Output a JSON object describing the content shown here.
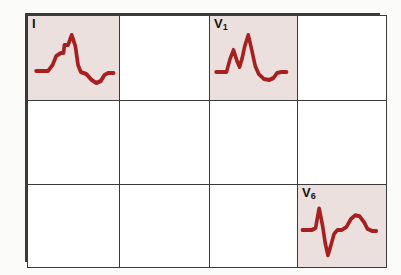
{
  "figure": {
    "name": "ecg-lead-grid",
    "background_color": "#fbfbf9",
    "border_color": "#3a3a3a",
    "cell_background": "#ffffff",
    "highlight_color": "#ece0df",
    "waveform_color": "#a62020",
    "columns": 4,
    "rows": 3
  },
  "cells": [
    {
      "row": 0,
      "col": 0,
      "label": "I",
      "label_base": "I",
      "label_sub": "",
      "highlighted": true,
      "has_waveform": true,
      "waveform_name": "lead-i-waveform",
      "morphology": "slurred notched R wave with tall peak and negative T wave",
      "path": "M 9 55 L 22 55 L 27 49 L 31 40 L 36 37 L 39 37 L 40 29 L 44 29 L 48 19 L 52 30 L 55 49 L 58 56 L 64 58 L 70 64 L 75 67 L 80 65 L 84 59 L 88 57 L 94 57"
    },
    {
      "row": 0,
      "col": 1,
      "label": "",
      "label_base": "",
      "label_sub": "",
      "highlighted": false,
      "has_waveform": false,
      "waveform_name": "",
      "morphology": "",
      "path": ""
    },
    {
      "row": 0,
      "col": 2,
      "label": "V1",
      "label_base": "V",
      "label_sub": "1",
      "highlighted": true,
      "has_waveform": true,
      "waveform_name": "lead-v1-waveform",
      "morphology": "rSR prime M-shaped complex with negative T wave",
      "path": "M 7 56 L 19 56 L 23 43 L 27 34 L 31 45 L 34 51 L 37 42 L 40 30 L 44 19 L 48 34 L 52 50 L 56 58 L 62 63 L 68 64 L 73 62 L 77 57 L 82 56 L 88 56"
    },
    {
      "row": 0,
      "col": 3,
      "label": "",
      "label_base": "",
      "label_sub": "",
      "highlighted": false,
      "has_waveform": false,
      "waveform_name": "",
      "morphology": "",
      "path": ""
    },
    {
      "row": 1,
      "col": 0,
      "label": "",
      "label_base": "",
      "label_sub": "",
      "highlighted": false,
      "has_waveform": false,
      "waveform_name": "",
      "morphology": "",
      "path": ""
    },
    {
      "row": 1,
      "col": 1,
      "label": "",
      "label_base": "",
      "label_sub": "",
      "highlighted": false,
      "has_waveform": false,
      "waveform_name": "",
      "morphology": "",
      "path": ""
    },
    {
      "row": 1,
      "col": 2,
      "label": "",
      "label_base": "",
      "label_sub": "",
      "highlighted": false,
      "has_waveform": false,
      "waveform_name": "",
      "morphology": "",
      "path": ""
    },
    {
      "row": 1,
      "col": 3,
      "label": "",
      "label_base": "",
      "label_sub": "",
      "highlighted": false,
      "has_waveform": false,
      "waveform_name": "",
      "morphology": "",
      "path": ""
    },
    {
      "row": 2,
      "col": 0,
      "label": "",
      "label_base": "",
      "label_sub": "",
      "highlighted": false,
      "has_waveform": false,
      "waveform_name": "",
      "morphology": "",
      "path": ""
    },
    {
      "row": 2,
      "col": 1,
      "label": "",
      "label_base": "",
      "label_sub": "",
      "highlighted": false,
      "has_waveform": false,
      "waveform_name": "",
      "morphology": "",
      "path": ""
    },
    {
      "row": 2,
      "col": 2,
      "label": "",
      "label_base": "",
      "label_sub": "",
      "highlighted": false,
      "has_waveform": false,
      "waveform_name": "",
      "morphology": "",
      "path": ""
    },
    {
      "row": 2,
      "col": 3,
      "label": "V6",
      "label_base": "V",
      "label_sub": "6",
      "highlighted": true,
      "has_waveform": true,
      "waveform_name": "lead-v6-waveform",
      "morphology": "narrow R spike with deep wide S wave and broad positive T wave",
      "path": "M 5 46 L 16 46 L 20 44 L 24 24 L 28 42 L 31 60 L 34 72 L 37 63 L 41 50 L 45 46 L 50 46 L 55 43 L 60 35 L 65 31 L 70 32 L 75 38 L 79 45 L 84 47 L 89 47"
    }
  ]
}
